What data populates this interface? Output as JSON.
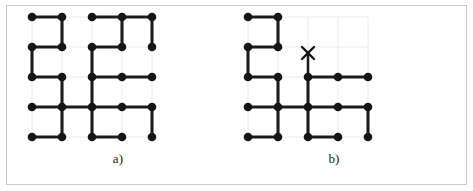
{
  "figure": {
    "background_color": "#ffffff",
    "frame_color": "#c9c9c9",
    "node_color": "#151515",
    "edge_color": "#1c1c1c",
    "grid_color": "#ececec",
    "marker_color": "#111111"
  },
  "panels": [
    {
      "id": "a",
      "label": "a)",
      "grid": {
        "rows": 5,
        "cols": 5,
        "spacing": 30,
        "origin_x": 20,
        "origin_y": 12
      },
      "nodes": [
        [
          0,
          0
        ],
        [
          0,
          1
        ],
        [
          0,
          2
        ],
        [
          0,
          3
        ],
        [
          0,
          4
        ],
        [
          1,
          0
        ],
        [
          1,
          1
        ],
        [
          1,
          2
        ],
        [
          1,
          3
        ],
        [
          1,
          4
        ],
        [
          2,
          0
        ],
        [
          2,
          1
        ],
        [
          2,
          2
        ],
        [
          2,
          3
        ],
        [
          2,
          4
        ],
        [
          3,
          0
        ],
        [
          3,
          1
        ],
        [
          3,
          2
        ],
        [
          3,
          3
        ],
        [
          3,
          4
        ],
        [
          4,
          0
        ],
        [
          4,
          1
        ],
        [
          4,
          2
        ],
        [
          4,
          3
        ],
        [
          4,
          4
        ]
      ],
      "edges": [
        [
          [
            0,
            0
          ],
          [
            0,
            1
          ]
        ],
        [
          [
            0,
            2
          ],
          [
            0,
            3
          ]
        ],
        [
          [
            0,
            3
          ],
          [
            0,
            4
          ]
        ],
        [
          [
            0,
            1
          ],
          [
            1,
            1
          ]
        ],
        [
          [
            0,
            3
          ],
          [
            1,
            3
          ]
        ],
        [
          [
            0,
            4
          ],
          [
            1,
            4
          ]
        ],
        [
          [
            1,
            0
          ],
          [
            1,
            1
          ]
        ],
        [
          [
            1,
            2
          ],
          [
            1,
            3
          ]
        ],
        [
          [
            1,
            0
          ],
          [
            2,
            0
          ]
        ],
        [
          [
            1,
            2
          ],
          [
            2,
            2
          ]
        ],
        [
          [
            2,
            0
          ],
          [
            2,
            1
          ]
        ],
        [
          [
            2,
            2
          ],
          [
            2,
            3
          ]
        ],
        [
          [
            2,
            3
          ],
          [
            2,
            4
          ]
        ],
        [
          [
            2,
            1
          ],
          [
            3,
            1
          ]
        ],
        [
          [
            2,
            2
          ],
          [
            3,
            2
          ]
        ],
        [
          [
            3,
            0
          ],
          [
            3,
            1
          ]
        ],
        [
          [
            3,
            1
          ],
          [
            3,
            2
          ]
        ],
        [
          [
            3,
            2
          ],
          [
            3,
            3
          ]
        ],
        [
          [
            3,
            3
          ],
          [
            3,
            4
          ]
        ],
        [
          [
            3,
            1
          ],
          [
            4,
            1
          ]
        ],
        [
          [
            3,
            2
          ],
          [
            4,
            2
          ]
        ],
        [
          [
            3,
            4
          ],
          [
            4,
            4
          ]
        ],
        [
          [
            4,
            0
          ],
          [
            4,
            1
          ]
        ],
        [
          [
            4,
            2
          ],
          [
            4,
            3
          ]
        ]
      ],
      "markers": []
    },
    {
      "id": "b",
      "label": "b)",
      "grid": {
        "rows": 5,
        "cols": 5,
        "spacing": 30,
        "origin_x": 20,
        "origin_y": 12
      },
      "nodes": [
        [
          0,
          0
        ],
        [
          0,
          1
        ],
        [
          1,
          0
        ],
        [
          1,
          1
        ],
        [
          2,
          0
        ],
        [
          2,
          1
        ],
        [
          2,
          2
        ],
        [
          2,
          3
        ],
        [
          2,
          4
        ],
        [
          3,
          0
        ],
        [
          3,
          1
        ],
        [
          3,
          2
        ],
        [
          3,
          3
        ],
        [
          3,
          4
        ],
        [
          4,
          0
        ],
        [
          4,
          1
        ],
        [
          4,
          2
        ],
        [
          4,
          3
        ],
        [
          4,
          4
        ]
      ],
      "edges": [
        [
          [
            0,
            0
          ],
          [
            0,
            1
          ]
        ],
        [
          [
            0,
            1
          ],
          [
            1,
            1
          ]
        ],
        [
          [
            1,
            0
          ],
          [
            1,
            1
          ]
        ],
        [
          [
            1,
            0
          ],
          [
            2,
            0
          ]
        ],
        [
          [
            2,
            0
          ],
          [
            2,
            1
          ]
        ],
        [
          [
            2,
            2
          ],
          [
            2,
            3
          ]
        ],
        [
          [
            2,
            3
          ],
          [
            2,
            4
          ]
        ],
        [
          [
            2,
            1
          ],
          [
            3,
            1
          ]
        ],
        [
          [
            2,
            2
          ],
          [
            3,
            2
          ]
        ],
        [
          [
            3,
            0
          ],
          [
            3,
            1
          ]
        ],
        [
          [
            3,
            1
          ],
          [
            3,
            2
          ]
        ],
        [
          [
            3,
            2
          ],
          [
            3,
            3
          ]
        ],
        [
          [
            3,
            3
          ],
          [
            3,
            4
          ]
        ],
        [
          [
            3,
            1
          ],
          [
            4,
            1
          ]
        ],
        [
          [
            3,
            2
          ],
          [
            4,
            2
          ]
        ],
        [
          [
            3,
            4
          ],
          [
            4,
            4
          ]
        ],
        [
          [
            4,
            0
          ],
          [
            4,
            1
          ]
        ],
        [
          [
            4,
            2
          ],
          [
            4,
            3
          ]
        ]
      ],
      "stubs": [
        {
          "from": [
            2,
            2
          ],
          "direction": "up",
          "length": 22
        }
      ],
      "markers": [
        {
          "type": "x-mark",
          "at": [
            2,
            2
          ],
          "offset_y": -24,
          "size": 6
        }
      ]
    }
  ]
}
